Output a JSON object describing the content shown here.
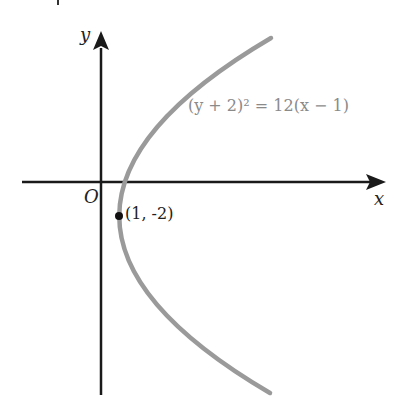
{
  "diagram": {
    "type": "parabola-graph",
    "equation": "(y + 2)² = 12(x − 1)",
    "vertex_label": "(1, -2)",
    "origin_label": "O",
    "x_axis_label": "x",
    "y_axis_label": "y",
    "colors": {
      "axes": "#1a1a1a",
      "curve": "#9a9a9a",
      "equation_text": "#8a8a8a",
      "point": "#111111"
    }
  }
}
